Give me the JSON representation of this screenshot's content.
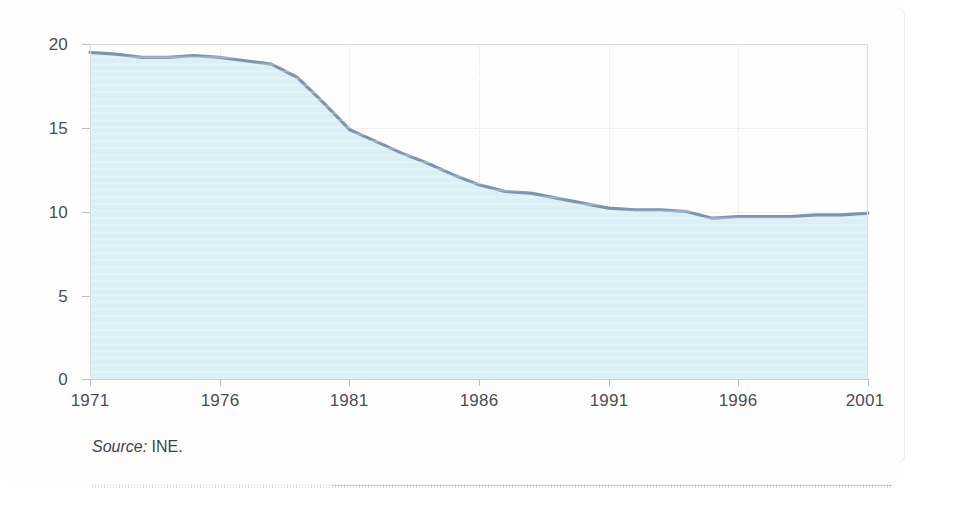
{
  "figure": {
    "source_label": "Source:",
    "source_value": "INE.",
    "accent_fill": "#dbeff6",
    "accent_line": "#7e94ae",
    "grid_color": "#e0dad3",
    "frame_color": "#d8dcdf",
    "text_color": "#4b4f53"
  },
  "chart_data": {
    "type": "area",
    "title": "",
    "subtitle": "",
    "xlabel": "",
    "ylabel": "",
    "xlim": [
      1971,
      2001
    ],
    "ylim": [
      0,
      20
    ],
    "grid": true,
    "legend_position": "none",
    "y_ticks": [
      0,
      5,
      10,
      15,
      20
    ],
    "y_tick_labels": [
      "0",
      "5",
      "10",
      "15",
      "20"
    ],
    "x_ticks": [
      1971,
      1976,
      1981,
      1986,
      1991,
      1996,
      2001
    ],
    "x_tick_labels": [
      "1971",
      "1976",
      "1981",
      "1986",
      "1991",
      "1996",
      "2001"
    ],
    "series": [
      {
        "name": "rate",
        "x": [
          1971,
          1972,
          1973,
          1974,
          1975,
          1976,
          1977,
          1978,
          1979,
          1980,
          1981,
          1982,
          1983,
          1984,
          1985,
          1986,
          1987,
          1988,
          1989,
          1990,
          1991,
          1992,
          1993,
          1994,
          1995,
          1996,
          1997,
          1998,
          1999,
          2000,
          2001
        ],
        "values": [
          19.5,
          19.4,
          19.2,
          19.2,
          19.3,
          19.2,
          19.0,
          18.8,
          18.0,
          16.5,
          14.9,
          14.2,
          13.5,
          12.9,
          12.2,
          11.6,
          11.2,
          11.1,
          10.8,
          10.5,
          10.2,
          10.1,
          10.1,
          10.0,
          9.6,
          9.7,
          9.7,
          9.7,
          9.8,
          9.8,
          9.9
        ],
        "fill": "#dbeff6",
        "stroke": "#7e94ae"
      }
    ],
    "annotations": [
      {
        "text": "Source: INE.",
        "position": "below-axis-left"
      }
    ]
  }
}
